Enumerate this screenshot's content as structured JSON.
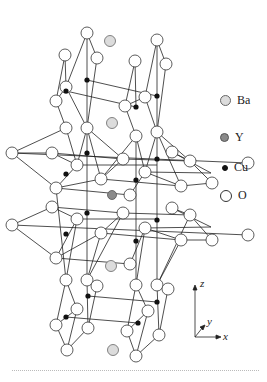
{
  "figure": {
    "legend": [
      {
        "label": "Ba",
        "fill": "#dcdcdc",
        "stroke": "#555555",
        "size": 11,
        "y": 100
      },
      {
        "label": "Y",
        "fill": "#8a8a8a",
        "stroke": "#555555",
        "size": 9,
        "y": 137
      },
      {
        "label": "Cu",
        "fill": "#111111",
        "stroke": "#111111",
        "size": 6,
        "y": 167
      },
      {
        "label": "O",
        "fill": "#ffffff",
        "stroke": "#333333",
        "size": 12,
        "y": 195
      }
    ],
    "axes": {
      "z": "z",
      "y": "y",
      "x": "x"
    },
    "colors": {
      "line": "#222222",
      "oxygen_fill": "#ffffff",
      "ba_fill": "#dcdcdc",
      "y_fill": "#8a8a8a",
      "cu_fill": "#111111",
      "rule": "#bbbbbb"
    }
  }
}
